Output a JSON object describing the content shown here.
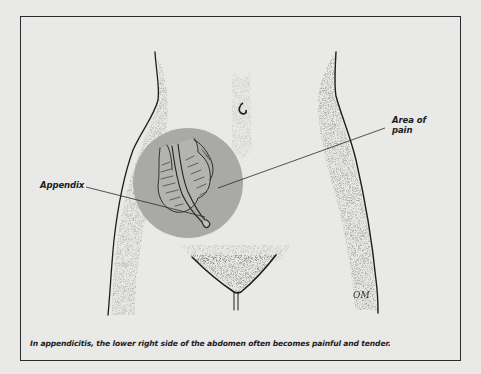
{
  "figure": {
    "labels": {
      "area_of_pain_line1": "Area of",
      "area_of_pain_line2": "pain",
      "appendix": "Appendix"
    },
    "caption": "In appendicitis, the lower right side of the abdomen often becomes painful and tender.",
    "signature": "OM",
    "colors": {
      "background": "#e9e9e7",
      "pain_area_circle": "#a9a9a7",
      "outline": "#1e1e1e"
    },
    "icons": [
      "abdomen-illustration",
      "appendix-illustration",
      "navel-icon",
      "pain-area-circle"
    ]
  }
}
